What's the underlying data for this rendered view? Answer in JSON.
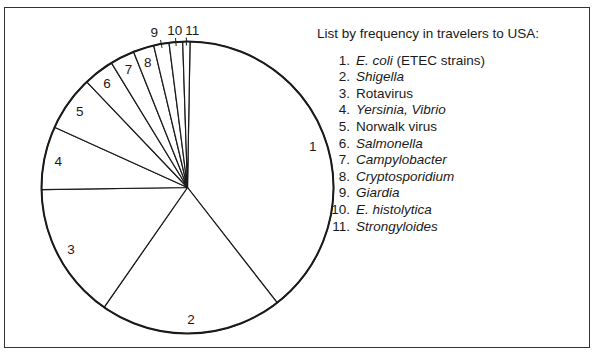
{
  "chart_data": {
    "type": "pie",
    "title": "",
    "legend_title": "List by frequency in travelers to USA:",
    "legend_position": "right",
    "start_angle_deg": 1,
    "direction": "clockwise",
    "categories": [
      "1",
      "2",
      "3",
      "4",
      "5",
      "6",
      "7",
      "8",
      "9",
      "10",
      "11"
    ],
    "items": [
      {
        "n": "1",
        "label": "E. coli (ETEC strains)",
        "italic": "E. coli",
        "rest": " (ETEC strains)",
        "percent": 39.2
      },
      {
        "n": "2",
        "label": "Shigella",
        "italic": "Shigella",
        "rest": "",
        "percent": 20.2
      },
      {
        "n": "3",
        "label": "Rotavirus",
        "italic": "",
        "rest": "Rotavirus",
        "percent": 15.1
      },
      {
        "n": "4",
        "label": "Yersinia, Vibrio",
        "italic": "Yersinia, Vibrio",
        "rest": "",
        "percent": 7.0
      },
      {
        "n": "5",
        "label": "Norwalk virus",
        "italic": "",
        "rest": "Norwalk virus",
        "percent": 6.1
      },
      {
        "n": "6",
        "label": "Salmonella",
        "italic": "Salmonella",
        "rest": "",
        "percent": 3.4
      },
      {
        "n": "7",
        "label": "Campylobacter",
        "italic": "Campylobacter",
        "rest": "",
        "percent": 2.7
      },
      {
        "n": "8",
        "label": "Cryptosporidium",
        "italic": "Cryptosporidium",
        "rest": "",
        "percent": 2.3
      },
      {
        "n": "9",
        "label": "Giardia",
        "italic": "Giardia",
        "rest": "",
        "percent": 1.7
      },
      {
        "n": "10",
        "label": "E. histolytica",
        "italic": "E. histolytica",
        "rest": "",
        "percent": 1.5
      },
      {
        "n": "11",
        "label": "Strongyloides",
        "italic": "Strongyloides",
        "rest": "",
        "percent": 0.8
      }
    ],
    "values": [
      39.2,
      20.2,
      15.1,
      7.0,
      6.1,
      3.4,
      2.7,
      2.3,
      1.7,
      1.5,
      0.8
    ],
    "colors": {
      "fill": "#ffffff",
      "stroke": "#1a1a1a"
    }
  }
}
